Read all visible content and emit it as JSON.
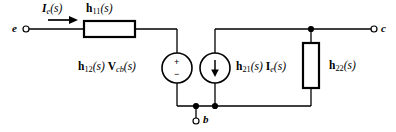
{
  "diagram": {
    "type": "circuit-schematic",
    "stroke_color": "#000000",
    "background_color": "#ffffff",
    "terminals": [
      {
        "id": "e",
        "label": "e",
        "x": 25,
        "y": 29,
        "side": "left"
      },
      {
        "id": "b",
        "label": "b",
        "x": 196,
        "y": 122,
        "side": "bottom"
      },
      {
        "id": "c",
        "label": "c",
        "x": 371,
        "y": 29,
        "side": "right"
      }
    ],
    "elements": [
      {
        "id": "h11",
        "kind": "resistor",
        "label": "h11(s)",
        "label_base": "h",
        "label_sub": "11",
        "label_arg": "(s)",
        "orientation": "horizontal"
      },
      {
        "id": "h12",
        "kind": "voltage-source",
        "label": "h12(s) Vcb(s)",
        "label_base": "h",
        "label_sub": "12",
        "label_arg": "(s)",
        "label_base2": "V",
        "label_sub2": "cb",
        "label_arg2": "(s)",
        "polarity_top": "+",
        "polarity_bottom": "−"
      },
      {
        "id": "h21",
        "kind": "current-source",
        "label": "h21(s) Ie(s)",
        "label_base": "h",
        "label_sub": "21",
        "label_arg": "(s)",
        "label_base2": "I",
        "label_sub2": "e",
        "label_arg2": "(s)",
        "arrow_direction": "down"
      },
      {
        "id": "h22",
        "kind": "resistor",
        "label": "h22(s)",
        "label_base": "h",
        "label_sub": "22",
        "label_arg": "(s)",
        "orientation": "vertical"
      }
    ],
    "current_arrow": {
      "id": "Ie",
      "label_base": "I",
      "label_sub": "e",
      "label_arg": "(s)",
      "direction": "right"
    },
    "junction_dots": [
      {
        "x": 196,
        "y": 106
      },
      {
        "x": 215,
        "y": 106
      },
      {
        "x": 311,
        "y": 29
      }
    ]
  }
}
